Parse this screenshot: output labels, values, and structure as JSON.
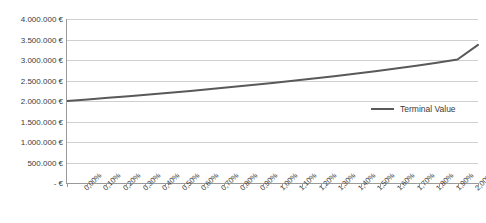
{
  "chart_data": {
    "type": "line",
    "title": "",
    "xlabel": "",
    "ylabel": "",
    "grid": "horizontal",
    "legend_position": "right",
    "ylim": [
      0,
      4000000
    ],
    "y_tick_step": 500000,
    "y_ticks": [
      4000000,
      3500000,
      3000000,
      2500000,
      2000000,
      1500000,
      1000000,
      500000,
      0
    ],
    "y_tick_labels": [
      "4.000.000 €",
      "3.500.000 €",
      "3.000.000 €",
      "2.500.000 €",
      "2.000.000 €",
      "1.500.000 €",
      "1.000.000 €",
      "500.000 €",
      "-   €"
    ],
    "categories": [
      "0,00%",
      "0,10%",
      "0,20%",
      "0,30%",
      "0,40%",
      "0,50%",
      "0,60%",
      "0,70%",
      "0,80%",
      "0,90%",
      "1,00%",
      "1,10%",
      "1,20%",
      "1,30%",
      "1,40%",
      "1,50%",
      "1,60%",
      "1,70%",
      "1,80%",
      "1,90%",
      "2,00%"
    ],
    "series": [
      {
        "name": "Terminal Value",
        "color": "#595959",
        "values": [
          2000000,
          2038000,
          2077000,
          2117000,
          2159000,
          2202000,
          2246000,
          2292000,
          2339000,
          2388000,
          2439000,
          2492000,
          2547000,
          2604000,
          2664000,
          2727000,
          2793000,
          2862000,
          2935000,
          3012000,
          3370000
        ]
      }
    ]
  },
  "legend": {
    "entries": [
      {
        "label": "Terminal Value"
      }
    ]
  },
  "colors": {
    "series_line": "#595959",
    "gridline": "#d0d0d0",
    "axis": "#9a9a9a",
    "text": "#3b3b3b",
    "background": "#ffffff"
  }
}
